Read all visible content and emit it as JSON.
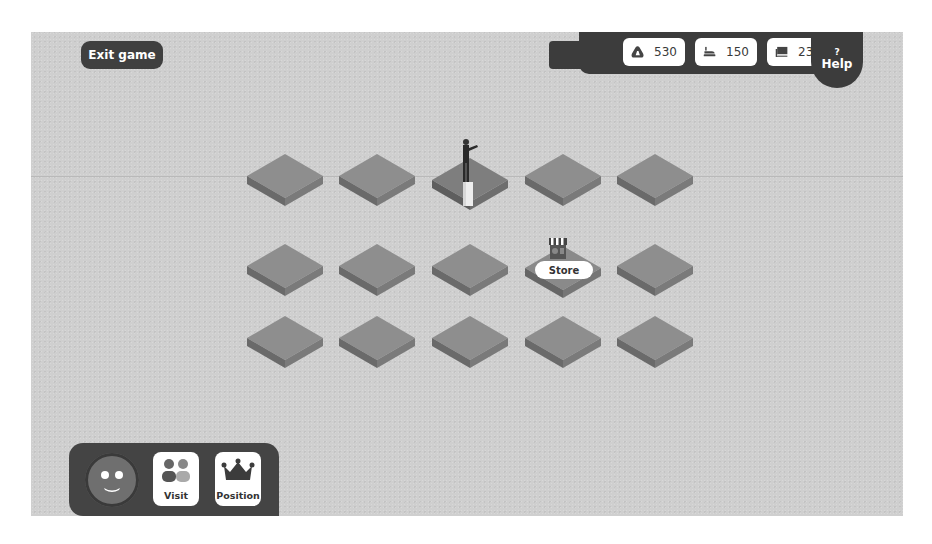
{
  "header": {
    "exit_label": "Exit game",
    "help_symbol": "?",
    "help_label": "Help"
  },
  "resources": [
    {
      "icon": "stone-icon",
      "value": "530"
    },
    {
      "icon": "iron-icon",
      "value": "150"
    },
    {
      "icon": "book-icon",
      "value": "235"
    }
  ],
  "board": {
    "columns": 5,
    "rows": 3,
    "player_tile": {
      "row": 0,
      "col": 2
    },
    "store_tile": {
      "row": 1,
      "col": 3
    },
    "store_label": "Store"
  },
  "player_panel": {
    "avatar": "smiley-avatar",
    "buttons": [
      {
        "icon": "people-icon",
        "label": "Visit"
      },
      {
        "icon": "crown-icon",
        "label": "Position"
      }
    ]
  },
  "colors": {
    "background": "#cfcfcf",
    "panel": "#3c3c3c",
    "tile_top": "#8e8e8e",
    "tile_side": "#6a6a6a"
  }
}
